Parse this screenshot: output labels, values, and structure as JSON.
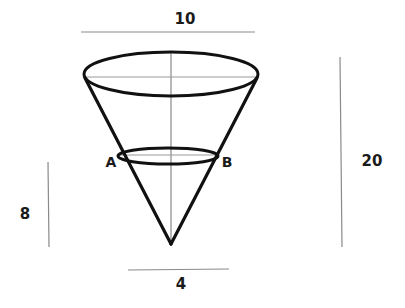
{
  "diagram": {
    "labels": {
      "top_diameter": "10",
      "height": "20",
      "section_height": "8",
      "bottom_width": "4",
      "point_a": "A",
      "point_b": "B"
    },
    "colors": {
      "outline": "#111111",
      "guide": "#9a9a9a",
      "text": "#1a1a1a"
    }
  }
}
